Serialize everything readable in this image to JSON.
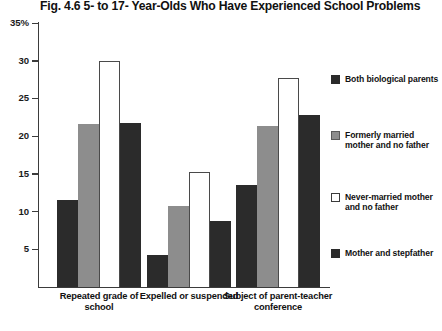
{
  "chart_data": {
    "type": "bar",
    "title": "Fig. 4.6  5- to 17- Year-Olds Who Have Experienced School Problems",
    "xlabel": "",
    "ylabel": "",
    "ylim": [
      0,
      35
    ],
    "ytick_labels": [
      "35%",
      "30",
      "25",
      "20",
      "15",
      "10",
      "5"
    ],
    "ytick_values": [
      35,
      30,
      25,
      20,
      15,
      10,
      5
    ],
    "grid": false,
    "legend_position": "right",
    "categories": [
      "Repeated grade of school",
      "Expelled or suspended",
      "Subject of parent-teacher conference"
    ],
    "series": [
      {
        "name": "Both biological parents",
        "color": "#2b2b2b",
        "values": [
          11.5,
          4.3,
          13.5
        ]
      },
      {
        "name": "Formerly married mother and no father",
        "color": "#8d8d8d",
        "values": [
          21.6,
          10.8,
          21.4
        ]
      },
      {
        "name": "Never-married mother and no father",
        "color": "#ffffff",
        "values": [
          30.0,
          15.3,
          27.7
        ]
      },
      {
        "name": "Mother and stepfather",
        "color": "#2b2b2b",
        "values": [
          21.7,
          8.8,
          22.8
        ]
      }
    ]
  }
}
